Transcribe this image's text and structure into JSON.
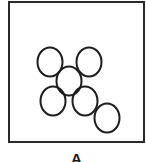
{
  "figure": {
    "label": "A",
    "frame": {
      "x": 9,
      "y": 2,
      "width": 135,
      "height": 140,
      "stroke": "#2a2a2a",
      "stroke_width": 2
    },
    "ellipse_style": {
      "rx": 12.5,
      "ry": 14.5,
      "stroke": "#1e1e1e",
      "stroke_width": 2,
      "fill": "none"
    },
    "ellipses": [
      {
        "id": "top-left",
        "cx": 50,
        "cy": 62
      },
      {
        "id": "top-right",
        "cx": 89,
        "cy": 62
      },
      {
        "id": "center",
        "cx": 69,
        "cy": 81
      },
      {
        "id": "bottom-left",
        "cx": 53,
        "cy": 101
      },
      {
        "id": "bottom-middle",
        "cx": 85,
        "cy": 101
      },
      {
        "id": "bottom-right",
        "cx": 107,
        "cy": 118
      }
    ]
  }
}
